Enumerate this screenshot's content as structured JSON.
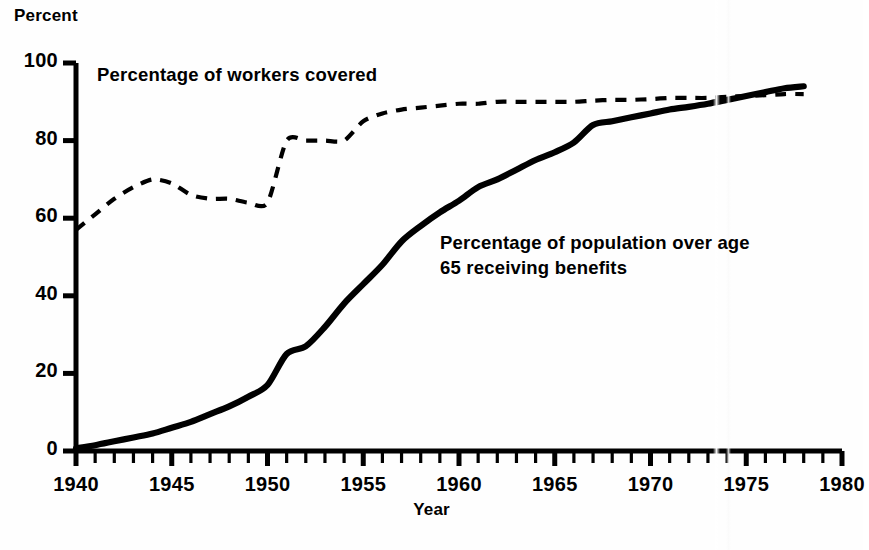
{
  "chart_data": {
    "type": "line",
    "title": "",
    "xlabel": "Year",
    "ylabel": "Percent",
    "xlim": [
      1940,
      1980
    ],
    "ylim": [
      0,
      100
    ],
    "xticks": [
      1940,
      1945,
      1950,
      1955,
      1960,
      1965,
      1970,
      1975,
      1980
    ],
    "xtick_labels": [
      "1940",
      "1945",
      "1950",
      "1955",
      "1960",
      "1965",
      "1970",
      "1975",
      "1980"
    ],
    "yticks": [
      0,
      20,
      40,
      60,
      80,
      100
    ],
    "ytick_labels": [
      "0",
      "20",
      "40",
      "60",
      "80",
      "100"
    ],
    "minor_xtick_interval": 1,
    "grid": false,
    "legend_position": "inline-annotations",
    "series": [
      {
        "name": "Percentage of workers covered",
        "style": "dashed",
        "color": "#000000",
        "label_text": "Percentage of workers covered",
        "x": [
          1940,
          1941,
          1942,
          1943,
          1944,
          1945,
          1946,
          1947,
          1948,
          1949,
          1950,
          1951,
          1952,
          1953,
          1954,
          1955,
          1956,
          1957,
          1958,
          1959,
          1960,
          1961,
          1962,
          1963,
          1964,
          1965,
          1966,
          1967,
          1968,
          1969,
          1970,
          1971,
          1972,
          1973,
          1974,
          1975,
          1976,
          1977,
          1978
        ],
        "values": [
          57,
          61,
          65,
          68,
          70,
          69,
          66,
          65,
          65,
          64,
          64,
          80,
          80,
          80,
          80,
          85,
          87,
          88,
          88.5,
          89,
          89.5,
          89.5,
          90,
          90,
          90,
          90,
          90,
          90.3,
          90.5,
          90.5,
          90.7,
          91,
          91,
          91,
          91.3,
          91.5,
          91.7,
          92,
          92
        ]
      },
      {
        "name": "Percentage of population over age 65 receiving benefits",
        "style": "solid",
        "color": "#000000",
        "label_text": "Percentage of population over age 65 receiving benefits",
        "x": [
          1940,
          1941,
          1942,
          1943,
          1944,
          1945,
          1946,
          1947,
          1948,
          1949,
          1950,
          1951,
          1952,
          1953,
          1954,
          1955,
          1956,
          1957,
          1958,
          1959,
          1960,
          1961,
          1962,
          1963,
          1964,
          1965,
          1966,
          1967,
          1968,
          1969,
          1970,
          1971,
          1972,
          1973,
          1974,
          1975,
          1976,
          1977,
          1978
        ],
        "values": [
          0.7,
          1.5,
          2.5,
          3.5,
          4.5,
          6,
          7.5,
          9.5,
          11.5,
          14,
          17,
          25,
          27,
          32,
          38,
          43,
          48,
          54,
          58,
          61.5,
          64.5,
          68,
          70,
          72.5,
          75,
          77,
          79.5,
          84,
          85,
          86,
          87,
          88,
          88.7,
          89.5,
          90.5,
          91.5,
          92.5,
          93.5,
          94
        ]
      }
    ]
  },
  "annotations": {
    "workers_label": "Percentage of workers covered",
    "population_label_line1": "Percentage of population over age",
    "population_label_line2": "65 receiving benefits"
  },
  "colors": {
    "line": "#000000",
    "axis": "#000000",
    "background": "#ffffff"
  }
}
